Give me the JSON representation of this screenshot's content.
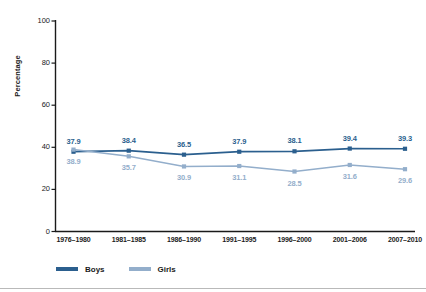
{
  "chart_data": {
    "type": "line",
    "title": "",
    "xlabel": "",
    "ylabel": "Percentage",
    "categories": [
      "1976–1980",
      "1981–1985",
      "1986–1990",
      "1991–1995",
      "1996–2000",
      "2001–2006",
      "2007–2010"
    ],
    "series": [
      {
        "name": "Boys",
        "color": "#2b5f8e",
        "values": [
          37.9,
          38.4,
          36.5,
          37.9,
          38.1,
          39.4,
          39.3
        ],
        "labels": [
          "37.9",
          "38.4",
          "36.5",
          "37.9",
          "38.1",
          "39.4",
          "39.3"
        ]
      },
      {
        "name": "Girls",
        "color": "#93aecb",
        "values": [
          38.9,
          35.7,
          30.9,
          31.1,
          28.5,
          31.6,
          29.6
        ],
        "labels": [
          "38.9",
          "35.7",
          "30.9",
          "31.1",
          "28.5",
          "31.6",
          "29.6"
        ]
      }
    ],
    "ylim": [
      0,
      100
    ],
    "yticks": [
      0,
      20,
      40,
      60,
      80,
      100
    ],
    "ytick_labels": [
      "0",
      "20",
      "40",
      "60",
      "80",
      "100"
    ],
    "grid": false,
    "legend_position": "bottom-left",
    "marker": "square"
  },
  "legend": {
    "items": [
      {
        "label": "Boys",
        "color": "#2b5f8e"
      },
      {
        "label": "Girls",
        "color": "#93aecb"
      }
    ]
  },
  "axis": {
    "y_title": "Percentage"
  }
}
